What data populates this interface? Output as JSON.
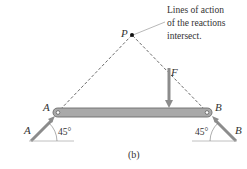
{
  "figure": {
    "caption": "(b)",
    "annotation": [
      "Lines of action",
      "of the reactions",
      "intersect."
    ],
    "point_label": "P",
    "force_label": "F",
    "support_a_label": "A",
    "support_b_label": "B",
    "reaction_a_label": "A",
    "reaction_b_label": "B",
    "angle_a": "45°",
    "angle_b": "45°",
    "colors": {
      "beam_fill": "#a9a9a9",
      "beam_stroke": "#6b6b6b",
      "arrow": "#8c8c8c",
      "dashed": "#444444",
      "ground": "#b0b0b0"
    }
  }
}
